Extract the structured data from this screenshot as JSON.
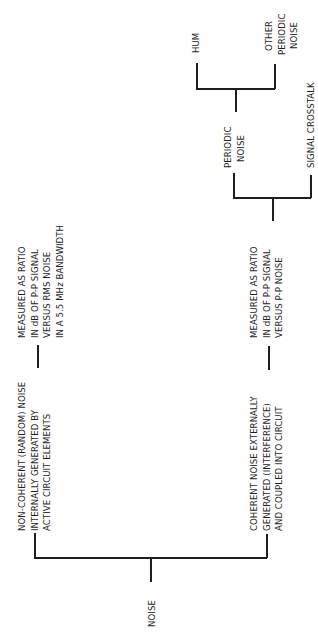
{
  "diagram": {
    "root": {
      "label": "NOISE"
    },
    "categories": [
      {
        "lines": [
          "NON-COHERENT (RANDOM)  NOISE",
          "INTERNALLY GENERATED BY",
          "ACTIVE CIRCUIT ELEMENTS"
        ],
        "measurement": [
          "MEASURED AS RATIO",
          "IN dB OF P-P SIGNAL",
          "VERSUS RMS NOISE",
          "IN A 5.5 MHz BANDWIDTH"
        ]
      },
      {
        "lines": [
          "COHERENT NOISE EXTERNALLY",
          "GENERATED (INTERFERENCE)",
          "AND COUPLED INTO CIRCUIT"
        ],
        "measurement": [
          "MEASURED AS RATIO",
          "IN dB OF P-P SIGNAL",
          "VERSUS P-P NOISE"
        ],
        "subtypes": [
          {
            "lines": [
              "PERIODIC",
              "NOISE"
            ],
            "subtypes": [
              {
                "lines": [
                  "HUM"
                ]
              },
              {
                "lines": [
                  "OTHER",
                  "PERIODIC",
                  "NOISE"
                ]
              }
            ]
          },
          {
            "lines": [
              "SIGNAL CROSSTALK"
            ]
          }
        ]
      }
    ]
  }
}
